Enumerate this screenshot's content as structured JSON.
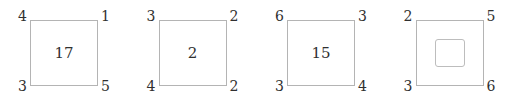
{
  "figure": {
    "background_color": "#ffffff",
    "stroke_color": "#b4b4b4",
    "text_color": "#303030",
    "panel_count": 4
  },
  "panels": [
    {
      "name": "panel-1",
      "corners": {
        "top_left": "4",
        "top_right": "1",
        "bottom_left": "3",
        "bottom_right": "5"
      },
      "center_label": "17",
      "center_type": "number"
    },
    {
      "name": "panel-2",
      "corners": {
        "top_left": "3",
        "top_right": "2",
        "bottom_left": "4",
        "bottom_right": "2"
      },
      "center_label": "2",
      "center_type": "number"
    },
    {
      "name": "panel-3",
      "corners": {
        "top_left": "6",
        "top_right": "3",
        "bottom_left": "3",
        "bottom_right": "4"
      },
      "center_label": "15",
      "center_type": "number"
    },
    {
      "name": "panel-4",
      "corners": {
        "top_left": "2",
        "top_right": "5",
        "bottom_left": "3",
        "bottom_right": "6"
      },
      "center_label": "",
      "center_type": "nested-square"
    }
  ]
}
